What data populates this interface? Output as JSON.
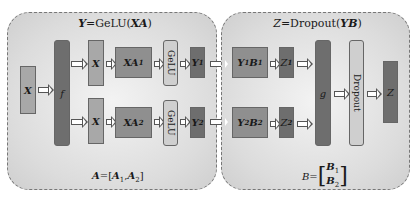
{
  "left_panel": {
    "title_var": "Y",
    "title_eq": "=GeLU(",
    "title_arg": "XA",
    "title_close": ")",
    "input": "X",
    "split": "f",
    "branch1": {
      "x": "X",
      "xa": "XA",
      "xa_sub": "1",
      "gelu": "GeLU",
      "y": "Y",
      "y_sub": "1"
    },
    "branch2": {
      "x": "X",
      "xa": "XA",
      "xa_sub": "2",
      "gelu": "GeLU",
      "y": "Y",
      "y_sub": "2"
    },
    "footer_lhs": "A",
    "footer_eq": "=[",
    "footer_a1": "A",
    "footer_a1_sub": "1",
    "footer_comma": ",",
    "footer_a2": "A",
    "footer_a2_sub": "2",
    "footer_close": "]"
  },
  "right_panel": {
    "title_var": "Z",
    "title_eq": "=Dropout(",
    "title_arg": "YB",
    "title_close": ")",
    "branch1": {
      "yb_y": "Y",
      "yb_y_sub": "1",
      "yb_b": "B",
      "yb_b_sub": "1",
      "z": "Z",
      "z_sub": "1"
    },
    "branch2": {
      "yb_y": "Y",
      "yb_y_sub": "2",
      "yb_b": "B",
      "yb_b_sub": "2",
      "z": "Z",
      "z_sub": "2"
    },
    "merge": "g",
    "dropout": "Dropout",
    "output": "Z",
    "footer_lhs": "B",
    "footer_eq": "=",
    "footer_b1": "B",
    "footer_b1_sub": "1",
    "footer_b2": "B",
    "footer_b2_sub": "2"
  }
}
